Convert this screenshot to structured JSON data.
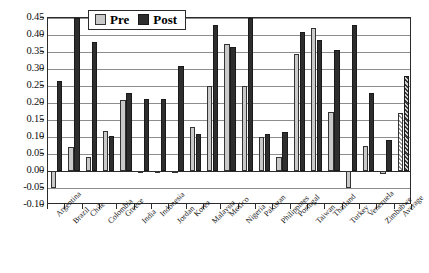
{
  "chart_data": {
    "type": "bar",
    "title": "",
    "xlabel": "",
    "ylabel": "",
    "ylim": [
      -0.1,
      0.45
    ],
    "ytick_step": 0.05,
    "yticks": [
      "0.45",
      "0.40",
      "0.35",
      "0.30",
      "0.25",
      "0.20",
      "0.15",
      "0.10",
      "0.05",
      "0.00",
      "-0.05",
      "-0.10"
    ],
    "ytick_values": [
      0.45,
      0.4,
      0.35,
      0.3,
      0.25,
      0.2,
      0.15,
      0.1,
      0.05,
      0.0,
      -0.05,
      -0.1
    ],
    "grid": true,
    "legend_position": "top-center",
    "categories": [
      "Argentina",
      "Brazil",
      "Chile",
      "Colombia",
      "Greece",
      "India",
      "Indonesia",
      "Jordan",
      "Korea",
      "Malaysia",
      "Mexico",
      "Nigeria",
      "Pakistan",
      "Philippines",
      "Portugal",
      "Taiwan",
      "Thailand",
      "Turkey",
      "Venezuela",
      "Zimbabwe",
      "Average"
    ],
    "series": [
      {
        "name": "Pre",
        "color": "#c9c9c9",
        "values": [
          -0.05,
          0.07,
          0.04,
          0.118,
          0.21,
          -0.005,
          0.0,
          0.0,
          0.13,
          0.25,
          0.375,
          0.25,
          0.1,
          0.04,
          0.345,
          0.42,
          0.175,
          -0.05,
          0.075,
          -0.01,
          0.17
        ]
      },
      {
        "name": "Post",
        "color": "#2e2e2e",
        "values": [
          0.265,
          0.45,
          0.38,
          0.103,
          0.228,
          0.212,
          0.212,
          0.31,
          0.108,
          0.43,
          0.365,
          0.45,
          0.11,
          0.115,
          0.41,
          0.385,
          0.355,
          0.43,
          0.23,
          0.09,
          0.28
        ]
      }
    ],
    "hatched_category": "Average"
  },
  "legend": {
    "items": [
      {
        "label": "Pre"
      },
      {
        "label": "Post"
      }
    ]
  }
}
